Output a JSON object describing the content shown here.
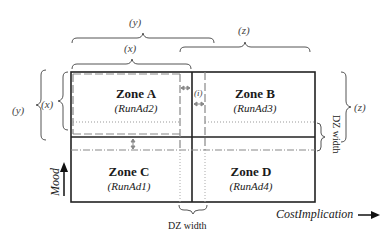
{
  "diagram": {
    "zones": [
      {
        "id": "A",
        "title": "Zone A",
        "subtitle": "(RunAd2)"
      },
      {
        "id": "B",
        "title": "Zone B",
        "subtitle": "(RunAd3)"
      },
      {
        "id": "C",
        "title": "Zone C",
        "subtitle": "(RunAd1)"
      },
      {
        "id": "D",
        "title": "Zone D",
        "subtitle": "(RunAd4)"
      }
    ],
    "braces": {
      "top_outer": "(y)",
      "top_inner": "(x)",
      "top_right": "(z)",
      "left_outer": "(y)",
      "left_inner": "(x)",
      "right": "(z)",
      "gap": "(i)"
    },
    "dz_width_bottom": "DZ width",
    "dz_width_right": "DZ width",
    "axes": {
      "x_label": "CostImplication",
      "y_label": "Mood"
    },
    "colors": {
      "solid_line": "#222222",
      "dashed_line": "#888888",
      "dotted_line": "#999999",
      "arrow_gray": "#888888"
    }
  }
}
